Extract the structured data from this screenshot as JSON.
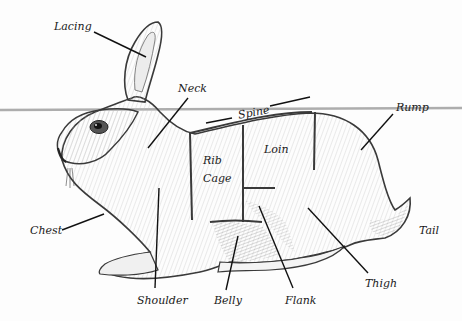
{
  "diagram": {
    "colors": {
      "outline": "#3a3a3a",
      "leader": "#111111",
      "fur_shade": "#8a8a8a",
      "background": "#fdfdfd",
      "fold_line": "#9a9a9a"
    },
    "labels": {
      "lacing": "Lacing",
      "neck": "Neck",
      "spine": "Spine",
      "rump": "Rump",
      "rib_cage_1": "Rib",
      "rib_cage_2": "Cage",
      "loin": "Loin",
      "chest": "Chest",
      "tail": "Tail",
      "shoulder": "Shoulder",
      "belly": "Belly",
      "flank": "Flank",
      "thigh": "Thigh"
    }
  }
}
